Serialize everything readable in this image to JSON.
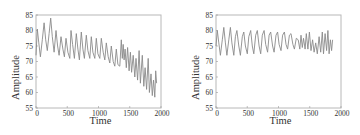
{
  "chart_data": [
    {
      "type": "line",
      "title": "",
      "xlabel": "Time",
      "ylabel": "Amplitude",
      "xlim": [
        0,
        2000
      ],
      "ylim": [
        55,
        85
      ],
      "xticks": [
        0,
        500,
        1000,
        1500,
        2000
      ],
      "yticks": [
        55,
        60,
        65,
        70,
        75,
        80,
        85
      ],
      "grid": false,
      "legend": null,
      "line_color": "#8a8a8a",
      "series": [
        {
          "name": "signal",
          "x": [
            0,
            20,
            45,
            70,
            100,
            130,
            155,
            180,
            210,
            235,
            260,
            290,
            320,
            345,
            370,
            400,
            430,
            455,
            480,
            510,
            540,
            560,
            585,
            615,
            645,
            670,
            695,
            725,
            750,
            775,
            805,
            830,
            860,
            885,
            910,
            940,
            965,
            990,
            1020,
            1045,
            1075,
            1100,
            1125,
            1155,
            1180,
            1205,
            1235,
            1260,
            1285,
            1310,
            1340,
            1365,
            1380,
            1395,
            1410,
            1425,
            1445,
            1465,
            1490,
            1510,
            1530,
            1555,
            1580,
            1600,
            1625,
            1650,
            1670,
            1700,
            1725,
            1745,
            1770,
            1795,
            1815,
            1840,
            1860,
            1880,
            1900,
            1915,
            1930
          ],
          "y": [
            72,
            80.5,
            76,
            71.5,
            77,
            82.5,
            77,
            73.5,
            79,
            84,
            78,
            73,
            80,
            75,
            72,
            78,
            74,
            71.5,
            77.5,
            73,
            71,
            80,
            75.5,
            71,
            79,
            74,
            70.5,
            79.5,
            74,
            71,
            78.5,
            73.5,
            71,
            78,
            73,
            71,
            77.5,
            72.5,
            71,
            77.5,
            73,
            70.5,
            76,
            71.5,
            69.5,
            75,
            70,
            68.5,
            74,
            69,
            68.5,
            77,
            71,
            75.5,
            70.5,
            74,
            68,
            74.5,
            67,
            73,
            66.5,
            72,
            65,
            71,
            64,
            73.5,
            63,
            72,
            62,
            68,
            61,
            71,
            60,
            66,
            59,
            64,
            58.5,
            67,
            63
          ]
        }
      ]
    },
    {
      "type": "line",
      "title": "",
      "xlabel": "Time",
      "ylabel": "Amplitude",
      "xlim": [
        0,
        2000
      ],
      "ylim": [
        55,
        85
      ],
      "xticks": [
        0,
        500,
        1000,
        1500,
        2000
      ],
      "yticks": [
        55,
        60,
        65,
        70,
        75,
        80,
        85
      ],
      "grid": false,
      "legend": null,
      "line_color": "#8a8a8a",
      "series": [
        {
          "name": "signal",
          "x": [
            0,
            20,
            45,
            70,
            100,
            125,
            150,
            175,
            205,
            230,
            255,
            285,
            310,
            335,
            365,
            390,
            420,
            445,
            470,
            500,
            525,
            555,
            580,
            605,
            635,
            660,
            690,
            715,
            740,
            770,
            795,
            825,
            850,
            875,
            905,
            930,
            960,
            985,
            1010,
            1040,
            1065,
            1095,
            1120,
            1145,
            1175,
            1200,
            1230,
            1255,
            1285,
            1315,
            1340,
            1360,
            1380,
            1400,
            1425,
            1445,
            1470,
            1495,
            1520,
            1545,
            1570,
            1595,
            1620,
            1650,
            1675,
            1700,
            1720,
            1745,
            1770,
            1790,
            1810,
            1830,
            1850,
            1865
          ],
          "y": [
            75,
            80,
            76,
            72,
            77,
            81,
            76,
            72,
            77,
            81,
            76,
            72,
            78,
            80,
            75,
            72,
            78,
            79.5,
            75,
            72.5,
            78,
            80,
            75,
            72.5,
            78.5,
            80,
            75,
            72.5,
            78.5,
            80,
            75.5,
            73,
            78.5,
            79.5,
            75,
            73,
            78.5,
            79.5,
            75.5,
            73.5,
            78.5,
            79.5,
            75.5,
            74,
            78.5,
            79,
            75.5,
            74,
            77.5,
            77,
            74,
            78.5,
            74.5,
            77.5,
            74,
            79,
            74,
            79.5,
            73.5,
            77,
            73,
            76,
            72.5,
            78,
            73,
            79.5,
            72.5,
            79,
            73.5,
            80,
            72.5,
            77,
            73.5,
            77
          ]
        }
      ]
    }
  ]
}
